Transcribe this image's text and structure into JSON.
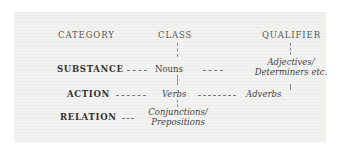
{
  "headers": {
    "category": "CATEGORY",
    "class": "CLASS",
    "qualifier": "QUALIFIER"
  },
  "rows": [
    {
      "category": "SUBSTANCE",
      "class": "Nouns",
      "qualifier": "Adjectives/ Determiners etc."
    },
    {
      "category": "ACTION",
      "class": "Verbs",
      "qualifier": "Adverbs"
    },
    {
      "category": "RELATION",
      "class": "Conjunctions/ Prepositions",
      "qualifier": ""
    }
  ],
  "labels": {
    "qualifier_line1": "Adjectives/",
    "qualifier_line2": "Determiners etc.",
    "relation_line1": "Conjunctions/",
    "relation_line2": "Prepositions"
  }
}
